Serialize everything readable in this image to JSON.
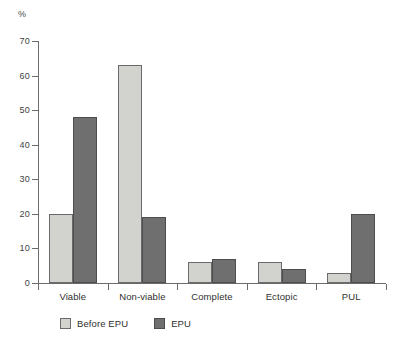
{
  "chart_data": {
    "type": "bar",
    "title": "",
    "subtitle": "",
    "xlabel": "",
    "ylabel": "%",
    "ylim": [
      0,
      70
    ],
    "ytick_values": [
      0,
      10,
      20,
      30,
      40,
      50,
      60,
      70
    ],
    "ytick_labels": [
      "0",
      "10",
      "20",
      "30",
      "40",
      "50",
      "60",
      "70"
    ],
    "grid": false,
    "legend_position": "bottom-left",
    "categories": [
      "Viable",
      "Non-viable",
      "Complete",
      "Ectopic",
      "PUL"
    ],
    "series": [
      {
        "name": "Before EPU",
        "color": "#d2d2cf",
        "values": [
          20,
          63,
          6,
          6,
          3
        ]
      },
      {
        "name": "EPU",
        "color": "#6f6f6f",
        "values": [
          48,
          19,
          7,
          4,
          20
        ]
      }
    ]
  },
  "legend": {
    "items": [
      {
        "label": "Before EPU",
        "swatch_class": "series-before"
      },
      {
        "label": "EPU",
        "swatch_class": "series-epu"
      }
    ]
  },
  "colors": {
    "before_epu": "#d2d2cf",
    "epu": "#6f6f6f",
    "axis": "#6b6b6b",
    "text": "#2f2f2f",
    "background": "#ffffff"
  }
}
